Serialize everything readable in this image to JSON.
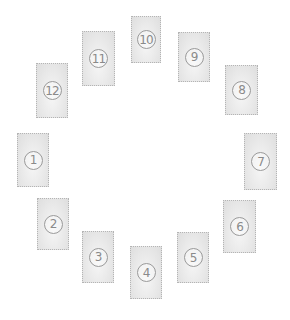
{
  "diagram": {
    "title": "",
    "layout": "circular spread of 12 cards",
    "colors": {
      "card_fill": "#e6e6e6",
      "card_border": "#b4b4b4",
      "number_color": "#8a8a8a"
    },
    "cards": [
      {
        "label": "1",
        "x": 17,
        "y": 133,
        "w": 32,
        "h": 54
      },
      {
        "label": "2",
        "x": 37,
        "y": 198,
        "w": 32,
        "h": 52
      },
      {
        "label": "3",
        "x": 82,
        "y": 231,
        "w": 32,
        "h": 52
      },
      {
        "label": "4",
        "x": 130,
        "y": 246,
        "w": 32,
        "h": 53
      },
      {
        "label": "5",
        "x": 177,
        "y": 232,
        "w": 32,
        "h": 51
      },
      {
        "label": "6",
        "x": 223,
        "y": 200,
        "w": 33,
        "h": 53
      },
      {
        "label": "7",
        "x": 244,
        "y": 133,
        "w": 33,
        "h": 57
      },
      {
        "label": "8",
        "x": 225,
        "y": 65,
        "w": 33,
        "h": 50
      },
      {
        "label": "9",
        "x": 178,
        "y": 32,
        "w": 32,
        "h": 50
      },
      {
        "label": "10",
        "x": 131,
        "y": 16,
        "w": 30,
        "h": 47
      },
      {
        "label": "11",
        "x": 82,
        "y": 31,
        "w": 33,
        "h": 55
      },
      {
        "label": "12",
        "x": 36,
        "y": 63,
        "w": 32,
        "h": 55
      }
    ]
  }
}
